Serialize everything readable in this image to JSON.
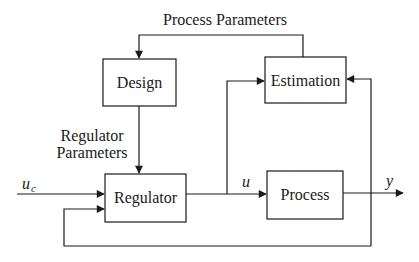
{
  "diagram": {
    "type": "block-diagram",
    "title": "",
    "blocks": {
      "design": {
        "label": "Design"
      },
      "estimation": {
        "label": "Estimation"
      },
      "regulator": {
        "label": "Regulator"
      },
      "process": {
        "label": "Process"
      }
    },
    "edge_labels": {
      "process_parameters": "Process Parameters",
      "regulator_parameters_line1": "Regulator",
      "regulator_parameters_line2": "Parameters",
      "u_c_main": "u",
      "u_c_sub": "c",
      "u": "u",
      "y": "y"
    },
    "edges": [
      {
        "from": "estimation",
        "to": "design",
        "label": "Process Parameters"
      },
      {
        "from": "design",
        "to": "regulator",
        "label": "Regulator Parameters"
      },
      {
        "from": "input",
        "to": "regulator",
        "label": "u_c"
      },
      {
        "from": "regulator",
        "to": "process",
        "label": "u"
      },
      {
        "from": "regulator",
        "to": "estimation",
        "label": "u"
      },
      {
        "from": "process",
        "to": "output",
        "label": "y"
      },
      {
        "from": "process_output",
        "to": "estimation",
        "label": "y"
      },
      {
        "from": "process_output",
        "to": "regulator",
        "label": "y (feedback)"
      }
    ]
  }
}
